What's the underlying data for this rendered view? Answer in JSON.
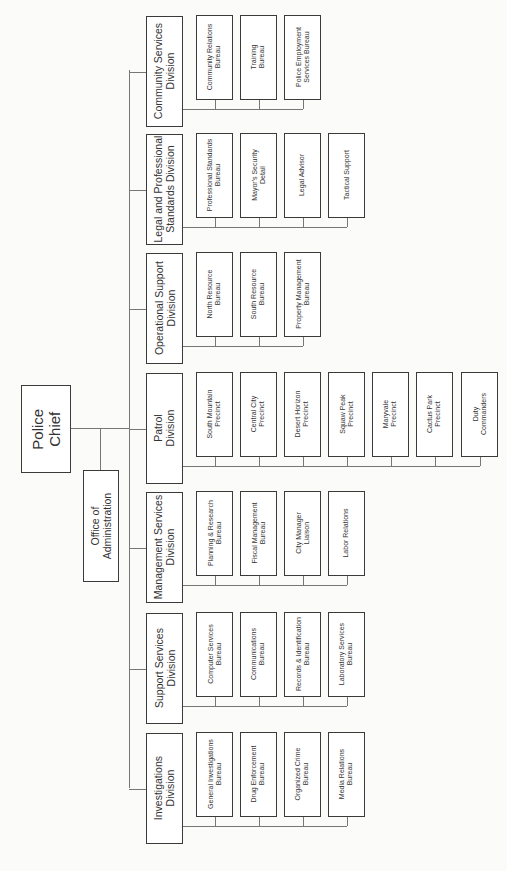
{
  "chart_data": {
    "type": "org-chart",
    "orientation": "rotated-90-ccw",
    "root": "Police Chief",
    "staff": [
      "Office of Administration"
    ],
    "divisions": [
      {
        "name": "Community Services Division",
        "units": [
          "Community Relations Bureau",
          "Training Bureau",
          "Police Employment Services Bureau"
        ]
      },
      {
        "name": "Legal and Professional Standards Division",
        "units": [
          "Professional Standards Bureau",
          "Mayor's Security Detail",
          "Legal Advisor",
          "Tactical Support"
        ]
      },
      {
        "name": "Operational Support Division",
        "units": [
          "North Resource Bureau",
          "South Resource Bureau",
          "Property Management Bureau"
        ]
      },
      {
        "name": "Patrol Division",
        "units": [
          "South Mountain Precinct",
          "Central City Precinct",
          "Desert Horizon Precinct",
          "Squaw Peak Precinct",
          "Maryvale Precinct",
          "Cactus Park Precinct",
          "Duty Commanders"
        ]
      },
      {
        "name": "Management Services Division",
        "units": [
          "Planning & Research Bureau",
          "Fiscal Management Bureau",
          "City Manager Liaison",
          "Labor Relations"
        ]
      },
      {
        "name": "Support Services Division",
        "units": [
          "Computer Services Bureau",
          "Communications Bureau",
          "Records & Identification Bureau",
          "Laboratory Services Bureau"
        ]
      },
      {
        "name": "Investigations Division",
        "units": [
          "General Investigations Bureau",
          "Drug Enforcement Bureau",
          "Organized Crime Bureau",
          "Media Relations Bureau"
        ]
      }
    ]
  },
  "chief": {
    "line1": "Police",
    "line2": "Chief"
  },
  "office": {
    "line1": "Office of",
    "line2": "Administration"
  },
  "divisions": [
    {
      "line1": "Community Services",
      "line2": "Division",
      "units": [
        [
          "Community Relations",
          "Bureau"
        ],
        [
          "Training",
          "Bureau"
        ],
        [
          "Police Employment",
          "Services Bureau"
        ]
      ]
    },
    {
      "line1": "Legal and Professional",
      "line2": "Standards Division",
      "units": [
        [
          "Professional Standards",
          "Bureau"
        ],
        [
          "Mayor's Security",
          "Detail"
        ],
        [
          "Legal Advisor",
          ""
        ],
        [
          "Tactical Support",
          ""
        ]
      ]
    },
    {
      "line1": "Operational Support",
      "line2": "Division",
      "units": [
        [
          "North Resource",
          "Bureau"
        ],
        [
          "South Resource",
          "Bureau"
        ],
        [
          "Property Management",
          "Bureau"
        ]
      ]
    },
    {
      "line1": "Patrol",
      "line2": "Division",
      "units": [
        [
          "South Mountain",
          "Precinct"
        ],
        [
          "Central City",
          "Precinct"
        ],
        [
          "Desert Horizon",
          "Precinct"
        ],
        [
          "Squaw Peak",
          "Precinct"
        ],
        [
          "Maryvale",
          "Precinct"
        ],
        [
          "Cactus Park",
          "Precinct"
        ],
        [
          "Duty",
          "Commanders"
        ]
      ]
    },
    {
      "line1": "Management Services",
      "line2": "Division",
      "units": [
        [
          "Planning & Research",
          "Bureau"
        ],
        [
          "Fiscal Management",
          "Bureau"
        ],
        [
          "City Manager",
          "Liaison"
        ],
        [
          "Labor Relations",
          ""
        ]
      ]
    },
    {
      "line1": "Support Services",
      "line2": "Division",
      "units": [
        [
          "Computer Services",
          "Bureau"
        ],
        [
          "Communications",
          "Bureau"
        ],
        [
          "Records & Identification",
          "Bureau"
        ],
        [
          "Laboratory Services",
          "Bureau"
        ]
      ]
    },
    {
      "line1": "Investigations",
      "line2": "Division",
      "units": [
        [
          "General Investigations",
          "Bureau"
        ],
        [
          "Drug Enforcement",
          "Bureau"
        ],
        [
          "Organized Crime",
          "Bureau"
        ],
        [
          "Media Relations",
          "Bureau"
        ]
      ]
    }
  ]
}
